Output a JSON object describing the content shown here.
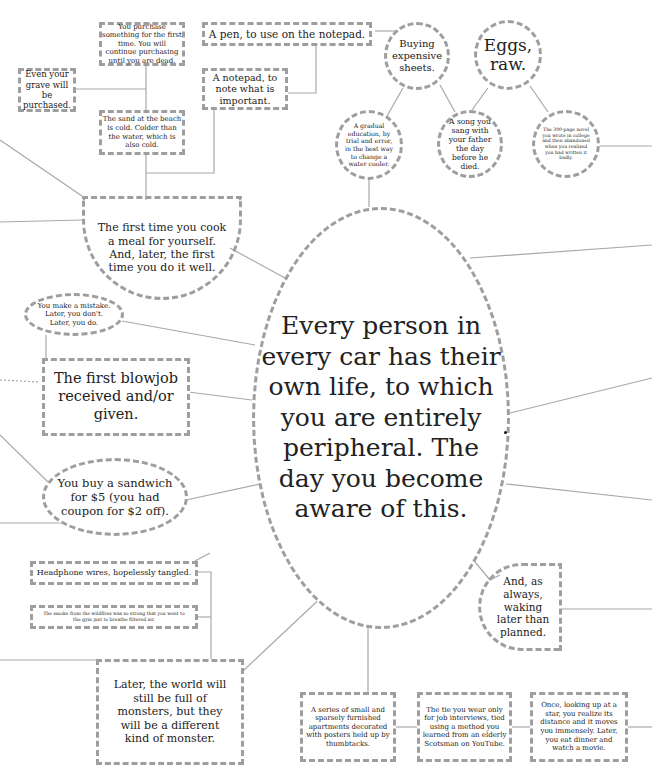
{
  "center": {
    "text": "Every person in every car has their own life, to which you are entirely peripheral. The day you become aware of this."
  },
  "nodes": {
    "purchase_first_time": "You purchase something for the first time. You will continue purchasing until you are dead.",
    "grave": "Even your grave will be purchased.",
    "sand_beach": "The sand at the beach is cold. Colder than the water, which is also cold.",
    "pen": "A pen, to use on the notepad.",
    "notepad": "A notepad, to note what is important.",
    "sheets": "Buying expensive sheets.",
    "eggs": "Eggs, raw.",
    "water_cooler": "A gradual education, by trial and error, in the best way to change a water cooler.",
    "song": "A song you sang with your father the day before he died.",
    "novel": "The 300-page novel you wrote in college and then abandoned when you realized you had written it badly.",
    "cook_meal": "The first time you cook a meal for yourself. And, later, the first time you do it well.",
    "mistake": "You make a mistake. Later, you don't. Later, you do.",
    "blowjob": "The first blowjob received and/or given.",
    "sandwich": "You buy a sandwich for $5 (you had coupon for $2 off).",
    "headphones": "Headphone wires, hopelessly tangled.",
    "wildfire": "The smoke from the wildfires was so strong that you went to the gym just to breathe filtered air.",
    "monsters": "Later, the world will still be full of monsters, but they will be a different kind of monster.",
    "apartments": "A series of small and sparsely furnished apartments decorated with posters held up by thumbtacks.",
    "tie": "The tie you wear only for job interviews, tied using a method you learned from an elderly Scotsman on YouTube.",
    "star": "Once, looking up at a star, you realize its distance and it moves you immensely. Later, you eat dinner and watch a movie.",
    "waking": "And, as always, waking later than planned."
  },
  "colors": {
    "border": "#9e9e9e",
    "line": "#a8a8a8",
    "text": "#222222",
    "background": "#ffffff"
  }
}
